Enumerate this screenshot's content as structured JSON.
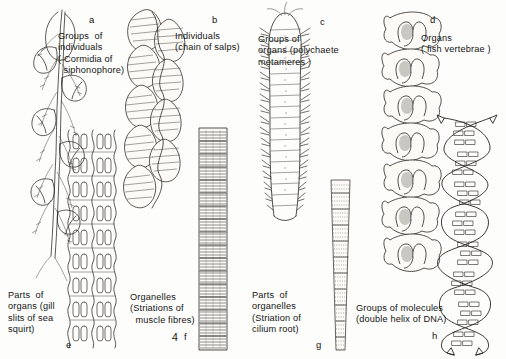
{
  "figure": {
    "number": "4",
    "background_color": "#fdfdfb",
    "ink_color": "#26241f"
  },
  "panels": [
    {
      "id": "a",
      "letter": "a",
      "caption": "Groups  of\nindividuals\n( Cormidia of\n  siphonophore)",
      "caption_lines": [
        "Groups  of",
        "individuals",
        "( Cormidia of",
        "siphonophore)"
      ],
      "subject": "siphonophore-colony",
      "level": "groups-of-individuals"
    },
    {
      "id": "b",
      "letter": "b",
      "caption": "Individuals\n(chain of salps)",
      "caption_lines": [
        "Individuals",
        "(chain of salps)"
      ],
      "subject": "salp-chain",
      "level": "individuals"
    },
    {
      "id": "c",
      "letter": "c",
      "caption": "Groups of\norgans (polychaete\nmetameres )",
      "caption_lines": [
        "Groups of",
        "organs (polychaete",
        "metameres )"
      ],
      "subject": "polychaete-worm",
      "level": "groups-of-organs"
    },
    {
      "id": "d",
      "letter": "d",
      "caption": "Organs\n( fish vertebrae )",
      "caption_lines": [
        "Organs",
        "( fish vertebrae )"
      ],
      "subject": "fish-vertebrae",
      "level": "organs"
    },
    {
      "id": "e",
      "letter": "e",
      "caption": "Parts  of\norgans (gill\nslits of sea\nsquirt)",
      "caption_lines": [
        "Parts  of",
        "organs (gill",
        "slits of sea",
        "squirt)"
      ],
      "subject": "sea-squirt-gill-slits",
      "level": "parts-of-organs"
    },
    {
      "id": "f",
      "letter": "f",
      "caption": "Organelles\n(Striations of\n  muscle fibres)",
      "caption_lines": [
        "Organelles",
        "(Striations of",
        "  muscle fibres)"
      ],
      "subject": "muscle-fibre-striations",
      "level": "organelles"
    },
    {
      "id": "g",
      "letter": "g",
      "caption": "Parts  of\norganelles\n(Striation of\ncilium root)",
      "caption_lines": [
        "Parts  of",
        "organelles",
        "(Striation of",
        "cilium root)"
      ],
      "subject": "cilium-root-striation",
      "level": "parts-of-organelles"
    },
    {
      "id": "h",
      "letter": "h",
      "caption": "Groups of molecules\n(double helix of DNA)",
      "caption_lines": [
        "Groups of molecules",
        "(double helix of DNA)"
      ],
      "subject": "dna-double-helix",
      "level": "groups-of-molecules"
    }
  ]
}
